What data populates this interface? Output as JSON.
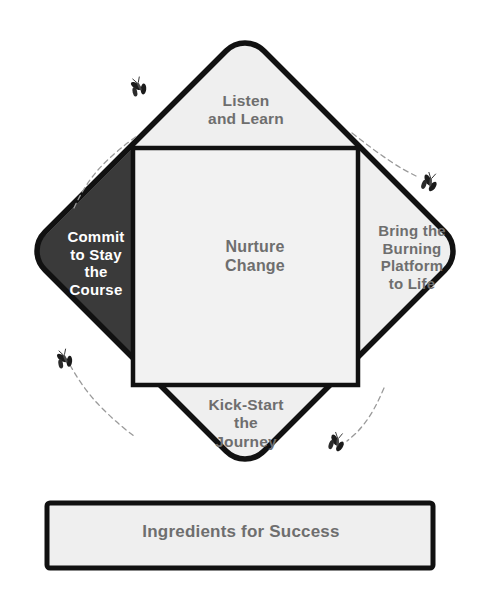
{
  "diagram": {
    "title_banner": {
      "text": "Ingredients for Success"
    },
    "center": {
      "name": "nurture-change",
      "text": "Nurture\nChange"
    },
    "quadrants": [
      {
        "id": "top",
        "name": "listen-and-learn",
        "text": "Listen\nand Learn",
        "fill": "#efefef",
        "text_color": "#6e6e6e",
        "highlighted": false
      },
      {
        "id": "left",
        "name": "commit-to-stay-the-course",
        "text": "Commit\nto Stay\nthe\nCourse",
        "fill": "#3a3a3a",
        "text_color": "#ffffff",
        "highlighted": true
      },
      {
        "id": "right",
        "name": "bring-the-burning-platform-to-life",
        "text": "Bring the\nBurning\nPlatform\nto Life",
        "fill": "#efefef",
        "text_color": "#6e6e6e",
        "highlighted": false
      },
      {
        "id": "bottom",
        "name": "kick-start-the-journey",
        "text": "Kick-Start\nthe\nJourney",
        "fill": "#efefef",
        "text_color": "#6e6e6e",
        "highlighted": false
      }
    ],
    "decorations": [
      {
        "name": "butterfly-icon",
        "position": "top-left"
      },
      {
        "name": "butterfly-icon",
        "position": "top-right"
      },
      {
        "name": "butterfly-icon",
        "position": "bottom-left"
      },
      {
        "name": "butterfly-icon",
        "position": "bottom-right"
      }
    ],
    "colors": {
      "outline": "#111111",
      "panel_fill": "#efefef",
      "center_fill": "#f2f2f2",
      "highlight_fill": "#3a3a3a",
      "label_gray": "#6e6e6e",
      "label_white": "#ffffff",
      "background": "#ffffff"
    }
  }
}
